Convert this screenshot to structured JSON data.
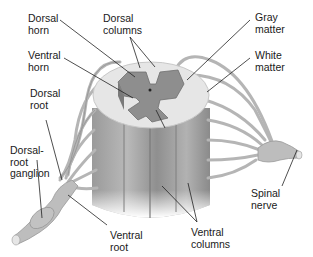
{
  "diagram": {
    "labels": {
      "dorsal_horn": "Dorsal\nhorn",
      "dorsal_columns": "Dorsal\ncolumns",
      "gray_matter": "Gray\nmatter",
      "white_matter": "White\nmatter",
      "ventral_horn": "Ventral\nhorn",
      "dorsal_root": "Dorsal\nroot",
      "dorsal_root_ganglion": "Dorsal-\nroot\nganglion",
      "ventral_root": "Ventral\nroot",
      "ventral_columns": "Ventral\ncolumns",
      "spinal_nerve": "Spinal\nnerve"
    },
    "colors": {
      "white_matter": "#e4e4e4",
      "gray_matter": "#8c8c8c",
      "cord_column": "#a8a8a8",
      "nerve": "#b8b8b8",
      "leader_line": "#222222"
    }
  }
}
